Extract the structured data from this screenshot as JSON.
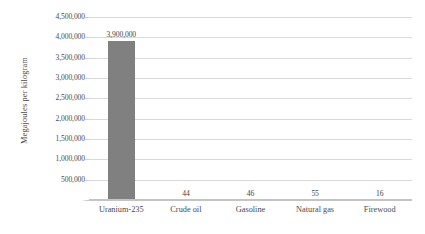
{
  "chart_data": {
    "type": "bar",
    "title": "",
    "subtitle": "",
    "xlabel": "",
    "ylabel": "Megajoules per kilogram",
    "categories": [
      "Uranium-235",
      "Crude oil",
      "Gasoline",
      "Natural gas",
      "Firewood"
    ],
    "values": [
      3900000,
      44,
      46,
      55,
      16
    ],
    "data_labels": [
      "3,900,000",
      "44",
      "46",
      "55",
      "16"
    ],
    "ylim": [
      0,
      4500000
    ],
    "ytick_values": [
      4500000,
      4000000,
      3500000,
      3000000,
      2500000,
      2000000,
      1500000,
      1000000,
      500000,
      0
    ],
    "ytick_labels": [
      "4,500,000",
      "4,000,000",
      "3,500,000",
      "3,000,000",
      "2,500,000",
      "2,000,000",
      "1,500,000",
      "1,000,000",
      "500,000",
      "-"
    ],
    "grid": true,
    "legend": false,
    "legend_position": "none",
    "series": [
      {
        "name": "Energy density",
        "values": [
          3900000,
          44,
          46,
          55,
          16
        ],
        "color": "#808080"
      }
    ],
    "colors": {
      "bar": "#808080",
      "gridline": "#d9d9d9",
      "axis": "#c4c4c4",
      "text": "#4a4a4a",
      "background": "#ffffff"
    }
  }
}
